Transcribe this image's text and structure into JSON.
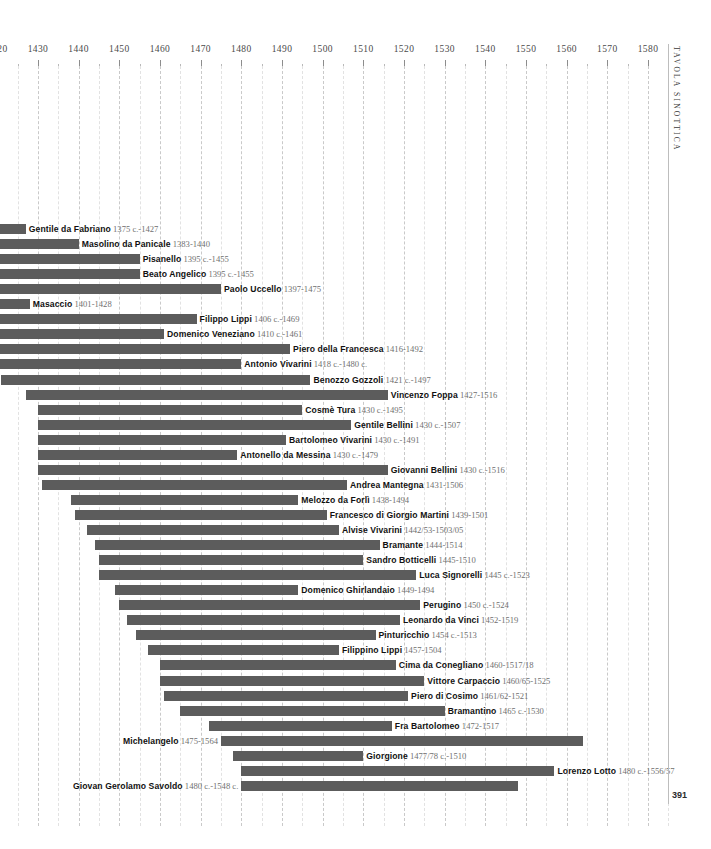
{
  "page": {
    "number": "391",
    "vertical_caption": "TAVOLA SINOTTICA",
    "bar_color": "#5c5c5c",
    "grid_color": "#c9c9c9"
  },
  "chart_data": {
    "type": "bar",
    "orientation": "horizontal",
    "title": "",
    "subtitle": "",
    "xlabel": "",
    "ylabel": "",
    "xlim": [
      1420,
      1585
    ],
    "grid": true,
    "legend": "none",
    "axis": {
      "major_step": 10,
      "minor_step": 5,
      "ticks": [
        1420,
        1430,
        1440,
        1450,
        1460,
        1470,
        1480,
        1490,
        1500,
        1510,
        1520,
        1530,
        1540,
        1550,
        1560,
        1570,
        1580
      ],
      "tick_labels": [
        "1420",
        "1430",
        "1440",
        "1450",
        "1460",
        "1470",
        "1480",
        "1490",
        "1500",
        "1510",
        "1520",
        "1530",
        "1540",
        "1550",
        "1560",
        "1570",
        "1580"
      ]
    },
    "categories": [
      "Gentile da Fabriano",
      "Masolino da Panicale",
      "Pisanello",
      "Beato Angelico",
      "Paolo Uccello",
      "Masaccio",
      "Filippo Lippi",
      "Domenico Veneziano",
      "Piero della Francesca",
      "Antonio Vivarini",
      "Benozzo Gozzoli",
      "Vincenzo Foppa",
      "Cosmè Tura",
      "Gentile Bellini",
      "Bartolomeo Vivarini",
      "Antonello da Messina",
      "Giovanni Bellini",
      "Andrea Mantegna",
      "Melozzo da Forlì",
      "Francesco di Giorgio Martini",
      "Alvise Vivarini",
      "Bramante",
      "Sandro Botticelli",
      "Luca Signorelli",
      "Domenico Ghirlandaio",
      "Perugino",
      "Leonardo da Vinci",
      "Pinturicchio",
      "Filippino Lippi",
      "Cima da Conegliano",
      "Vittore Carpaccio",
      "Piero di Cosimo",
      "Bramantino",
      "Fra Bartolomeo",
      "Michelangelo",
      "Giorgione",
      "Lorenzo Lotto",
      "Giovan Gerolamo Savoldo"
    ],
    "rows": [
      {
        "name": "Gentile da Fabriano",
        "dates": "1375 c.-1427",
        "start": 1375,
        "end": 1427,
        "label_side": "right"
      },
      {
        "name": "Masolino da Panicale",
        "dates": "1383-1440",
        "start": 1383,
        "end": 1440,
        "label_side": "right"
      },
      {
        "name": "Pisanello",
        "dates": "1395 c.-1455",
        "start": 1395,
        "end": 1455,
        "label_side": "right"
      },
      {
        "name": "Beato Angelico",
        "dates": "1395 c.-1455",
        "start": 1395,
        "end": 1455,
        "label_side": "right"
      },
      {
        "name": "Paolo Uccello",
        "dates": "1397-1475",
        "start": 1397,
        "end": 1475,
        "label_side": "right"
      },
      {
        "name": "Masaccio",
        "dates": "1401-1428",
        "start": 1401,
        "end": 1428,
        "label_side": "right"
      },
      {
        "name": "Filippo Lippi",
        "dates": "1406 c.-1469",
        "start": 1406,
        "end": 1469,
        "label_side": "right"
      },
      {
        "name": "Domenico Veneziano",
        "dates": "1410 c.-1461",
        "start": 1410,
        "end": 1461,
        "label_side": "right"
      },
      {
        "name": "Piero della Francesca",
        "dates": "1416-1492",
        "start": 1416,
        "end": 1492,
        "label_side": "right"
      },
      {
        "name": "Antonio Vivarini",
        "dates": "1418 c.-1480 c.",
        "start": 1418,
        "end": 1480,
        "label_side": "right"
      },
      {
        "name": "Benozzo Gozzoli",
        "dates": "1421 c.-1497",
        "start": 1421,
        "end": 1497,
        "label_side": "right"
      },
      {
        "name": "Vincenzo Foppa",
        "dates": "1427-1516",
        "start": 1427,
        "end": 1516,
        "label_side": "right"
      },
      {
        "name": "Cosmè Tura",
        "dates": "1430 c.-1495",
        "start": 1430,
        "end": 1495,
        "label_side": "right"
      },
      {
        "name": "Gentile Bellini",
        "dates": "1430 c.-1507",
        "start": 1430,
        "end": 1507,
        "label_side": "right"
      },
      {
        "name": "Bartolomeo Vivarini",
        "dates": "1430 c.-1491",
        "start": 1430,
        "end": 1491,
        "label_side": "right"
      },
      {
        "name": "Antonello da Messina",
        "dates": "1430 c.-1479",
        "start": 1430,
        "end": 1479,
        "label_side": "right"
      },
      {
        "name": "Giovanni Bellini",
        "dates": "1430 c.-1516",
        "start": 1430,
        "end": 1516,
        "label_side": "right"
      },
      {
        "name": "Andrea Mantegna",
        "dates": "1431-1506",
        "start": 1431,
        "end": 1506,
        "label_side": "right"
      },
      {
        "name": "Melozzo da Forlì",
        "dates": "1438-1494",
        "start": 1438,
        "end": 1494,
        "label_side": "right"
      },
      {
        "name": "Francesco di Giorgio Martini",
        "dates": "1439-1501",
        "start": 1439,
        "end": 1501,
        "label_side": "right"
      },
      {
        "name": "Alvise Vivarini",
        "dates": "1442/53-1503/05",
        "start": 1442,
        "end": 1504,
        "label_side": "right"
      },
      {
        "name": "Bramante",
        "dates": "1444-1514",
        "start": 1444,
        "end": 1514,
        "label_side": "right"
      },
      {
        "name": "Sandro Botticelli",
        "dates": "1445-1510",
        "start": 1445,
        "end": 1510,
        "label_side": "right"
      },
      {
        "name": "Luca Signorelli",
        "dates": "1445 c.-1523",
        "start": 1445,
        "end": 1523,
        "label_side": "right"
      },
      {
        "name": "Domenico Ghirlandaio",
        "dates": "1449-1494",
        "start": 1449,
        "end": 1494,
        "label_side": "right"
      },
      {
        "name": "Perugino",
        "dates": "1450 c.-1524",
        "start": 1450,
        "end": 1524,
        "label_side": "right"
      },
      {
        "name": "Leonardo da Vinci",
        "dates": "1452-1519",
        "start": 1452,
        "end": 1519,
        "label_side": "right"
      },
      {
        "name": "Pinturicchio",
        "dates": "1454 c.-1513",
        "start": 1454,
        "end": 1513,
        "label_side": "right"
      },
      {
        "name": "Filippino Lippi",
        "dates": "1457-1504",
        "start": 1457,
        "end": 1504,
        "label_side": "right"
      },
      {
        "name": "Cima da Conegliano",
        "dates": "1460-1517/18",
        "start": 1460,
        "end": 1518,
        "label_side": "right"
      },
      {
        "name": "Vittore Carpaccio",
        "dates": "1460/65-1525",
        "start": 1460,
        "end": 1525,
        "label_side": "right"
      },
      {
        "name": "Piero di Cosimo",
        "dates": "1461/62-1521",
        "start": 1461,
        "end": 1521,
        "label_side": "right"
      },
      {
        "name": "Bramantino",
        "dates": "1465 c.-1530",
        "start": 1465,
        "end": 1530,
        "label_side": "right"
      },
      {
        "name": "Fra Bartolomeo",
        "dates": "1472-1517",
        "start": 1472,
        "end": 1517,
        "label_side": "right"
      },
      {
        "name": "Michelangelo",
        "dates": "1475-1564",
        "start": 1475,
        "end": 1564,
        "label_side": "left"
      },
      {
        "name": "Giorgione",
        "dates": "1477/78 c.-1510",
        "start": 1478,
        "end": 1510,
        "label_side": "right"
      },
      {
        "name": "Lorenzo Lotto",
        "dates": "1480 c.-1556/57",
        "start": 1480,
        "end": 1557,
        "label_side": "right"
      },
      {
        "name": "Giovan Gerolamo Savoldo",
        "dates": "1480 c.-1548 c.",
        "start": 1480,
        "end": 1548,
        "label_side": "left"
      }
    ]
  }
}
